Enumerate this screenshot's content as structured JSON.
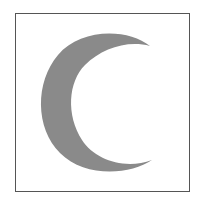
{
  "figure": {
    "shape": "crescent-moon",
    "fill_color": "#8a8a8a",
    "border_color": "#555555",
    "background_color": "#ffffff"
  }
}
